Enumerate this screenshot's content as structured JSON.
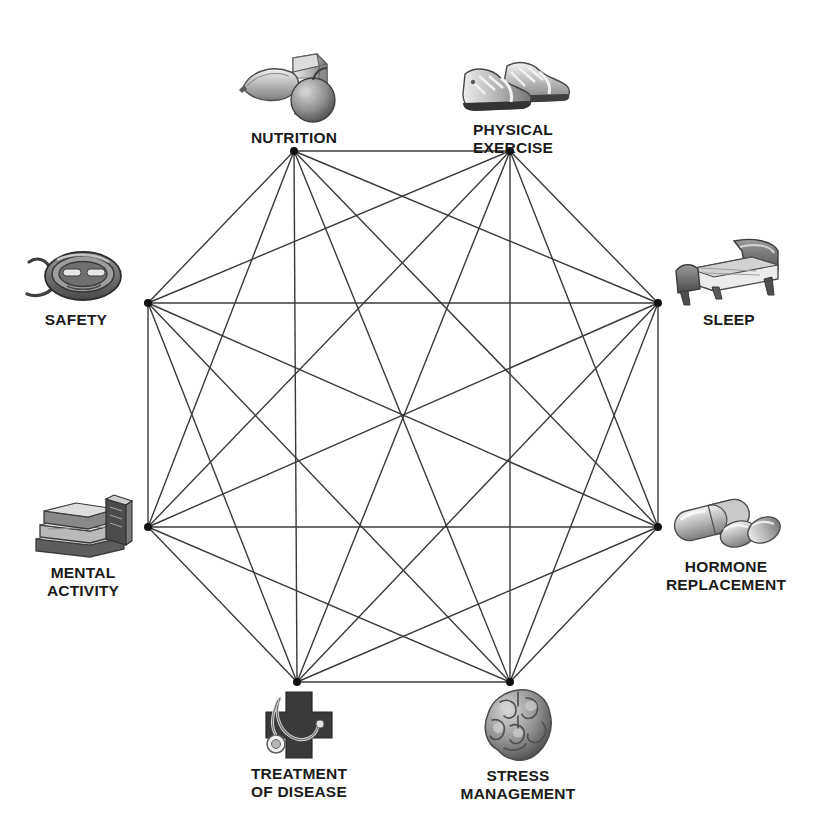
{
  "diagram": {
    "type": "complete-graph-octagon",
    "title_visible": false,
    "node_count": 8,
    "edge_count": 28,
    "line_color": "#3a3a3a",
    "vertex_color": "#111111",
    "background_color": "#ffffff",
    "label_color": "#1b1b1b",
    "nodes": [
      {
        "id": "nutrition",
        "label": "NUTRITION",
        "icon": "milk-banana-apple-icon",
        "vertex": {
          "x": 294,
          "y": 151
        }
      },
      {
        "id": "physical_exercise",
        "label": "PHYSICAL\nEXERCISE",
        "icon": "running-shoes-icon",
        "vertex": {
          "x": 510,
          "y": 151
        }
      },
      {
        "id": "sleep",
        "label": "SLEEP",
        "icon": "bed-icon",
        "vertex": {
          "x": 658,
          "y": 303
        }
      },
      {
        "id": "hormone_replacement",
        "label": "HORMONE\nREPLACEMENT",
        "icon": "pills-capsule-icon",
        "vertex": {
          "x": 658,
          "y": 527
        }
      },
      {
        "id": "stress_management",
        "label": "STRESS\nMANAGEMENT",
        "icon": "brain-icon",
        "vertex": {
          "x": 510,
          "y": 682
        }
      },
      {
        "id": "treatment_of_disease",
        "label": "TREATMENT\nOF DISEASE",
        "icon": "medical-cross-stethoscope-icon",
        "vertex": {
          "x": 297,
          "y": 682
        }
      },
      {
        "id": "mental_activity",
        "label": "MENTAL\nACTIVITY",
        "icon": "stack-of-books-icon",
        "vertex": {
          "x": 148,
          "y": 527
        }
      },
      {
        "id": "safety",
        "label": "SAFETY",
        "icon": "seatbelt-buckle-icon",
        "vertex": {
          "x": 148,
          "y": 303
        }
      }
    ],
    "edges": [
      [
        "nutrition",
        "physical_exercise"
      ],
      [
        "nutrition",
        "sleep"
      ],
      [
        "nutrition",
        "hormone_replacement"
      ],
      [
        "nutrition",
        "stress_management"
      ],
      [
        "nutrition",
        "treatment_of_disease"
      ],
      [
        "nutrition",
        "mental_activity"
      ],
      [
        "nutrition",
        "safety"
      ],
      [
        "physical_exercise",
        "sleep"
      ],
      [
        "physical_exercise",
        "hormone_replacement"
      ],
      [
        "physical_exercise",
        "stress_management"
      ],
      [
        "physical_exercise",
        "treatment_of_disease"
      ],
      [
        "physical_exercise",
        "mental_activity"
      ],
      [
        "physical_exercise",
        "safety"
      ],
      [
        "sleep",
        "hormone_replacement"
      ],
      [
        "sleep",
        "stress_management"
      ],
      [
        "sleep",
        "treatment_of_disease"
      ],
      [
        "sleep",
        "mental_activity"
      ],
      [
        "sleep",
        "safety"
      ],
      [
        "hormone_replacement",
        "stress_management"
      ],
      [
        "hormone_replacement",
        "treatment_of_disease"
      ],
      [
        "hormone_replacement",
        "mental_activity"
      ],
      [
        "hormone_replacement",
        "safety"
      ],
      [
        "stress_management",
        "treatment_of_disease"
      ],
      [
        "stress_management",
        "mental_activity"
      ],
      [
        "stress_management",
        "safety"
      ],
      [
        "treatment_of_disease",
        "mental_activity"
      ],
      [
        "treatment_of_disease",
        "safety"
      ],
      [
        "mental_activity",
        "safety"
      ]
    ]
  }
}
